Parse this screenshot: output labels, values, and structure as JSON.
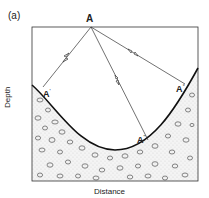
{
  "figure": {
    "panel_label": "(a)",
    "source_point": "A",
    "reflection_points": [
      {
        "label": "A",
        "superscript": "'"
      },
      {
        "label": "A",
        "superscript": "\""
      },
      {
        "label": "A",
        "superscript": "°"
      }
    ],
    "x_axis_label": "Distance",
    "y_axis_label": "Depth",
    "elements": {
      "box": {
        "x1": 32,
        "y1": 27,
        "x2": 198,
        "y2": 181
      },
      "source": {
        "x": 91,
        "y": 27
      },
      "rays": [
        {
          "to_x": 43,
          "to_y": 87
        },
        {
          "to_x": 148,
          "to_y": 140
        },
        {
          "to_x": 185,
          "to_y": 84
        }
      ],
      "interface": "curved valley-shaped boundary",
      "fill_pattern": "conglomerate / gravel (pebbles)"
    },
    "colors": {
      "line": "#333333",
      "fill": "#f2f2f2",
      "pebble": "#555555"
    }
  }
}
